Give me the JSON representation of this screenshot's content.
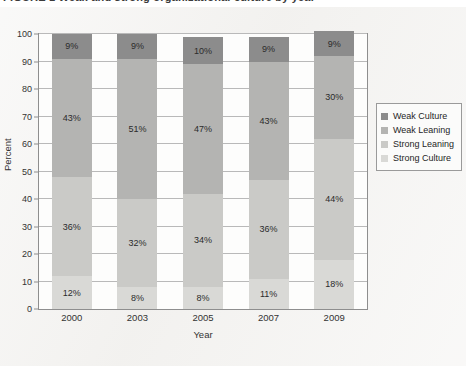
{
  "figure": {
    "caption": "FIGURE 1  Weak and strong organizational culture by year",
    "caption_clipped": true
  },
  "legend": {
    "position": "right",
    "items": [
      {
        "label": "Weak Culture",
        "color": "#8c8c8c"
      },
      {
        "label": "Weak Leaning",
        "color": "#b4b4b2"
      },
      {
        "label": "Strong Leaning",
        "color": "#cacac7"
      },
      {
        "label": "Strong Culture",
        "color": "#d9d9d6"
      }
    ]
  },
  "axes": {
    "y_title": "Percent",
    "x_title": "Year",
    "y_ticks": [
      "0",
      "10",
      "20",
      "30",
      "40",
      "50",
      "60",
      "70",
      "80",
      "90",
      "100"
    ]
  },
  "chart_data": {
    "type": "bar",
    "stacked": true,
    "title": "FIGURE 1  Weak and strong organizational culture by year",
    "xlabel": "Year",
    "ylabel": "Percent",
    "ylim": [
      0,
      100
    ],
    "yticks": [
      0,
      10,
      20,
      30,
      40,
      50,
      60,
      70,
      80,
      90,
      100
    ],
    "grid": true,
    "legend_position": "right",
    "units": "percent",
    "categories": [
      "2000",
      "2003",
      "2005",
      "2007",
      "2009"
    ],
    "series": [
      {
        "name": "Strong Culture",
        "color": "#d9d9d6",
        "values": [
          12,
          8,
          8,
          11,
          18
        ],
        "labels": [
          "12%",
          "8%",
          "8%",
          "11%",
          "18%"
        ]
      },
      {
        "name": "Strong Leaning",
        "color": "#cacac7",
        "values": [
          36,
          32,
          34,
          36,
          44
        ],
        "labels": [
          "36%",
          "32%",
          "34%",
          "36%",
          "44%"
        ]
      },
      {
        "name": "Weak Leaning",
        "color": "#b4b4b2",
        "values": [
          43,
          51,
          47,
          43,
          30
        ],
        "labels": [
          "43%",
          "51%",
          "47%",
          "43%",
          "30%"
        ]
      },
      {
        "name": "Weak Culture",
        "color": "#8c8c8c",
        "values": [
          9,
          9,
          10,
          9,
          9
        ],
        "labels": [
          "9%",
          "9%",
          "10%",
          "9%",
          "9%"
        ]
      }
    ],
    "stack_order_bottom_to_top": [
      "Strong Culture",
      "Strong Leaning",
      "Weak Leaning",
      "Weak Culture"
    ]
  }
}
